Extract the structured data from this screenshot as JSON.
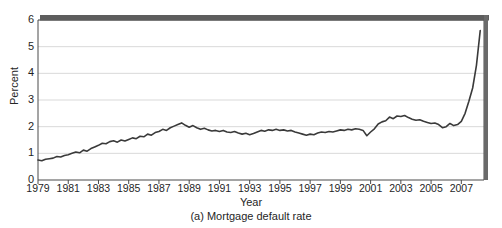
{
  "figure": {
    "caption": "(a) Mortgage default rate",
    "plot": {
      "left": 38,
      "right": 484,
      "top": 20,
      "bottom": 180
    }
  },
  "chart_data": {
    "type": "line",
    "title": "",
    "caption": "(a) Mortgage default rate",
    "xlabel": "Year",
    "ylabel": "Percent",
    "xlim": [
      1979,
      2008.5
    ],
    "ylim": [
      0,
      6
    ],
    "yticks": [
      0,
      1,
      2,
      3,
      4,
      5,
      6
    ],
    "ytick_labels": [
      "0",
      "1",
      "2",
      "3",
      "4",
      "5",
      "6"
    ],
    "xticks": [
      1979,
      1981,
      1983,
      1985,
      1987,
      1989,
      1991,
      1993,
      1995,
      1997,
      1999,
      2001,
      2003,
      2005,
      2007
    ],
    "xtick_labels": [
      "1979",
      "1981",
      "1983",
      "1985",
      "1987",
      "1989",
      "1991",
      "1993",
      "1995",
      "1997",
      "1999",
      "2001",
      "2003",
      "2005",
      "2007"
    ],
    "grid": "horizontal",
    "grid_color": "#d9d9d9",
    "legend": "none",
    "line_color": "#3a3a3a",
    "line_width": 1.6,
    "series": [
      {
        "name": "Mortgage default rate",
        "x": [
          1979.0,
          1979.25,
          1979.5,
          1979.75,
          1980.0,
          1980.25,
          1980.5,
          1980.75,
          1981.0,
          1981.25,
          1981.5,
          1981.75,
          1982.0,
          1982.25,
          1982.5,
          1982.75,
          1983.0,
          1983.25,
          1983.5,
          1983.75,
          1984.0,
          1984.25,
          1984.5,
          1984.75,
          1985.0,
          1985.25,
          1985.5,
          1985.75,
          1986.0,
          1986.25,
          1986.5,
          1986.75,
          1987.0,
          1987.25,
          1987.5,
          1987.75,
          1988.0,
          1988.25,
          1988.5,
          1988.75,
          1989.0,
          1989.25,
          1989.5,
          1989.75,
          1990.0,
          1990.25,
          1990.5,
          1990.75,
          1991.0,
          1991.25,
          1991.5,
          1991.75,
          1992.0,
          1992.25,
          1992.5,
          1992.75,
          1993.0,
          1993.25,
          1993.5,
          1993.75,
          1994.0,
          1994.25,
          1994.5,
          1994.75,
          1995.0,
          1995.25,
          1995.5,
          1995.75,
          1996.0,
          1996.25,
          1996.5,
          1996.75,
          1997.0,
          1997.25,
          1997.5,
          1997.75,
          1998.0,
          1998.25,
          1998.5,
          1998.75,
          1999.0,
          1999.25,
          1999.5,
          1999.75,
          2000.0,
          2000.25,
          2000.5,
          2000.75,
          2001.0,
          2001.25,
          2001.5,
          2001.75,
          2002.0,
          2002.25,
          2002.5,
          2002.75,
          2003.0,
          2003.25,
          2003.5,
          2003.75,
          2004.0,
          2004.25,
          2004.5,
          2004.75,
          2005.0,
          2005.25,
          2005.5,
          2005.75,
          2006.0,
          2006.25,
          2006.5,
          2006.75,
          2007.0,
          2007.25,
          2007.5,
          2007.75,
          2008.0,
          2008.25
        ],
        "values": [
          0.75,
          0.72,
          0.78,
          0.8,
          0.82,
          0.88,
          0.86,
          0.92,
          0.95,
          1.0,
          1.05,
          1.02,
          1.12,
          1.08,
          1.18,
          1.24,
          1.3,
          1.38,
          1.36,
          1.44,
          1.47,
          1.42,
          1.5,
          1.46,
          1.52,
          1.58,
          1.55,
          1.64,
          1.62,
          1.72,
          1.68,
          1.78,
          1.82,
          1.9,
          1.86,
          1.96,
          2.02,
          2.08,
          2.14,
          2.05,
          1.98,
          2.04,
          1.96,
          1.9,
          1.94,
          1.88,
          1.84,
          1.86,
          1.82,
          1.86,
          1.8,
          1.78,
          1.82,
          1.76,
          1.72,
          1.75,
          1.7,
          1.74,
          1.8,
          1.86,
          1.83,
          1.88,
          1.86,
          1.9,
          1.86,
          1.88,
          1.84,
          1.86,
          1.8,
          1.76,
          1.72,
          1.68,
          1.72,
          1.7,
          1.76,
          1.8,
          1.78,
          1.82,
          1.8,
          1.84,
          1.88,
          1.86,
          1.9,
          1.88,
          1.92,
          1.9,
          1.86,
          1.66,
          1.8,
          1.92,
          2.1,
          2.18,
          2.22,
          2.36,
          2.3,
          2.4,
          2.38,
          2.42,
          2.34,
          2.28,
          2.24,
          2.26,
          2.2,
          2.16,
          2.12,
          2.14,
          2.08,
          1.96,
          2.0,
          2.12,
          2.04,
          2.08,
          2.2,
          2.5,
          2.95,
          3.45,
          4.3,
          5.6
        ]
      }
    ],
    "annotations": [
      {
        "type": "scan-artifact",
        "description": "dark horizontal band along top frame"
      },
      {
        "type": "scan-artifact",
        "description": "dark vertical band along right frame"
      }
    ]
  }
}
